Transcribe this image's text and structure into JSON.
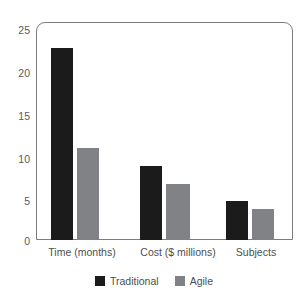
{
  "chart_data": {
    "type": "bar",
    "title": "",
    "subtitle": "",
    "xlabel": "",
    "ylabel": "",
    "ylim": [
      0,
      25
    ],
    "yticks": [
      0,
      5,
      10,
      15,
      20,
      25
    ],
    "ytick_labels": [
      "0",
      "5",
      "10",
      "15",
      "20",
      "25"
    ],
    "grid": false,
    "legend_position": "bottom",
    "categories": [
      "Time (months)",
      "Cost ($ millions)",
      "Subjects"
    ],
    "series": [
      {
        "name": "Traditional",
        "color": "#1b1b1b",
        "values": [
          22,
          8.5,
          4.5
        ]
      },
      {
        "name": "Agile",
        "color": "#808285",
        "values": [
          10.6,
          6.4,
          3.6
        ]
      }
    ]
  },
  "legend": {
    "items": [
      {
        "label": "Traditional",
        "swatch": "traditional-swatch"
      },
      {
        "label": "Agile",
        "swatch": "agile-swatch"
      }
    ]
  },
  "colors": {
    "traditional": "#1b1b1b",
    "agile": "#808285",
    "frame": "#7d7d7d",
    "tick_text": "#5a5b5d",
    "background": "#ffffff"
  }
}
